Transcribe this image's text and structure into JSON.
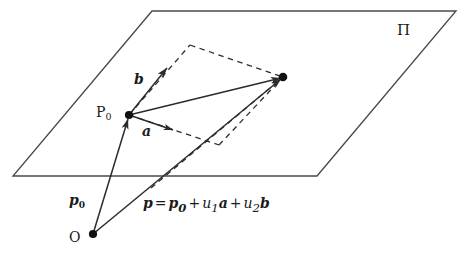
{
  "figure": {
    "type": "geometry-diagram",
    "plane_label": "Π",
    "point_labels": {
      "p0_point": "P",
      "p0_point_sub": "0",
      "origin": "O"
    },
    "vector_labels": {
      "a": "a",
      "b": "b",
      "p0": "p",
      "p0_sub": "0"
    },
    "equation": {
      "lhs": "p",
      "eq": "=",
      "term1": "p",
      "term1_sub": "0",
      "plus1": "+",
      "coef1": "u",
      "coef1_sub": "1",
      "basis1": "a",
      "plus2": "+",
      "coef2": "u",
      "coef2_sub": "2",
      "basis2": "b"
    },
    "caption_partial": "",
    "colors": {
      "stroke": "#3a3a3a",
      "ink": "#1a1a1a",
      "background": "#ffffff"
    },
    "geometry": {
      "plane_corners": [
        [
          152,
          11
        ],
        [
          456,
          11
        ],
        [
          317,
          176
        ],
        [
          13,
          176
        ]
      ],
      "p0_dot": [
        129,
        115
      ],
      "origin_dot": [
        93,
        234
      ],
      "tip_dot": [
        283,
        77
      ],
      "a_tip": [
        173,
        130
      ],
      "b_tip": [
        167,
        68
      ],
      "dash_top_vertex": [
        190,
        45
      ],
      "dash_bottom_vertex": [
        219,
        145
      ],
      "plane_crossing": [
        163,
        176
      ]
    }
  }
}
